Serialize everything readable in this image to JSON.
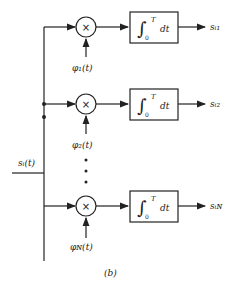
{
  "diagram": {
    "input_label": "s_i(t)",
    "input_text": "sᵢ(t)",
    "branches": [
      {
        "multiplier": "×",
        "basis": "φ₁(t)",
        "integrator_upper": "T",
        "integrator_lower": "0",
        "integrand": "dt",
        "output": "sᵢ₁"
      },
      {
        "multiplier": "×",
        "basis": "φ₂(t)",
        "integrator_upper": "T",
        "integrator_lower": "0",
        "integrand": "dt",
        "output": "sᵢ₂"
      },
      {
        "multiplier": "×",
        "basis": "φ_N(t)",
        "basis_text": "φɴ(t)",
        "integrator_upper": "T",
        "integrator_lower": "0",
        "integrand": "dt",
        "output": "sᵢɴ"
      }
    ],
    "ellipsis": "⋮",
    "caption": "(b)"
  }
}
